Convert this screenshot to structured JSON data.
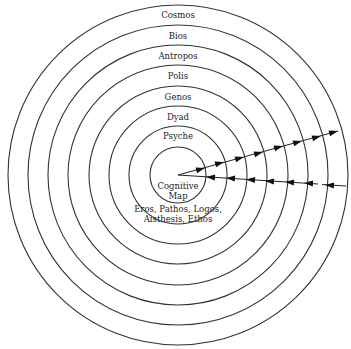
{
  "diagram": {
    "type": "concentric-circles",
    "center": {
      "x": 178,
      "y": 175
    },
    "rings": [
      {
        "label": "Cosmos",
        "radius": 170
      },
      {
        "label": "Bios",
        "radius": 150
      },
      {
        "label": "Antropos",
        "radius": 130
      },
      {
        "label": "Polis",
        "radius": 110
      },
      {
        "label": "Genos",
        "radius": 89
      },
      {
        "label": "Dyad",
        "radius": 69
      },
      {
        "label": "Psyche",
        "radius": 49
      },
      {
        "label": "Cognitive Map",
        "radius": 28
      }
    ],
    "core": {
      "line1": "Cognitive",
      "line2": "Map",
      "line3": "Eros, Pathos, Logos,",
      "line4": "Aisthesis, Ethos"
    },
    "arrows": {
      "outward": {
        "direction": "center-to-outer",
        "count": 8
      },
      "inward": {
        "direction": "outer-to-center",
        "count": 7
      }
    }
  }
}
